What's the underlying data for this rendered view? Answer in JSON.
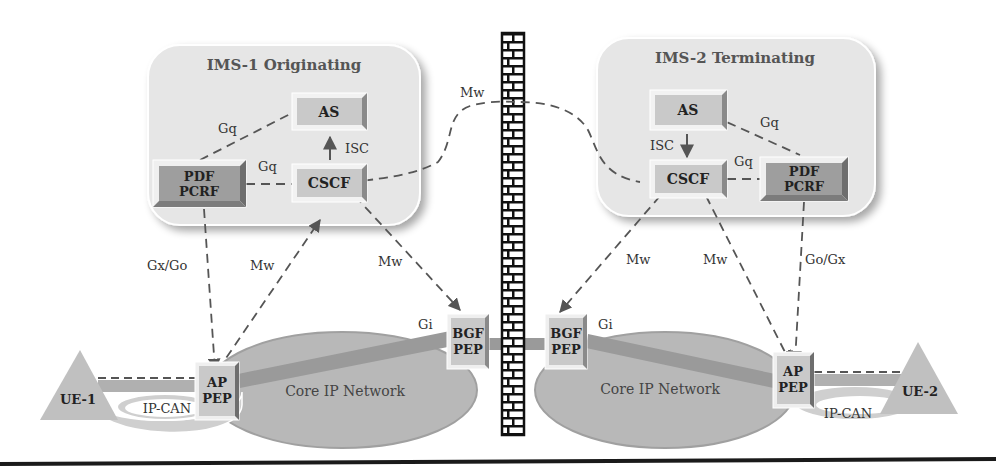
{
  "domains": {
    "ims1": {
      "title": "IMS-1 Originating"
    },
    "ims2": {
      "title": "IMS-2 Terminating"
    }
  },
  "nodes": {
    "as1": "AS",
    "cscf1": "CSCF",
    "pdf1_line1": "PDF",
    "pdf1_line2": "PCRF",
    "as2": "AS",
    "cscf2": "CSCF",
    "pdf2_line1": "PDF",
    "pdf2_line2": "PCRF",
    "ap1_line1": "AP",
    "ap1_line2": "PEP",
    "ap2_line1": "AP",
    "ap2_line2": "PEP",
    "bgf1_line1": "BGF",
    "bgf1_line2": "PEP",
    "bgf2_line1": "BGF",
    "bgf2_line2": "PEP",
    "ue1": "UE-1",
    "ue2": "UE-2",
    "ipcan1": "IP-CAN",
    "ipcan2": "IP-CAN",
    "core1": "Core IP Network",
    "core2": "Core IP Network"
  },
  "interfaces": {
    "gq_as_pdf1": "Gq",
    "gq_cscf_pdf1": "Gq",
    "isc1": "ISC",
    "mw_inter": "Mw",
    "gxgo1": "Gx/Go",
    "mw_ap1": "Mw",
    "mw_bgf1": "Mw",
    "gi1": "Gi",
    "gq_as_pdf2": "Gq",
    "gq_cscf_pdf2": "Gq",
    "isc2": "ISC",
    "mw_bgf2": "Mw",
    "mw_ap2": "Mw",
    "gogx2": "Go/Gx",
    "gi2": "Gi"
  },
  "colors": {
    "domain_fill": "#e6e6e6",
    "box_light": "#c9c9c9",
    "box_dark": "#9e9e9e",
    "network_fill": "#b8b8b8",
    "link_gray": "#999999",
    "line": "#555555"
  }
}
